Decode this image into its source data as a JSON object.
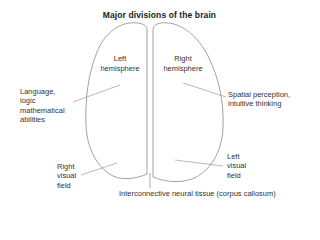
{
  "diagram": {
    "title": "Major divisions of the brain",
    "hemispheres": {
      "left": {
        "line1": "Left",
        "line2": "hemisphere"
      },
      "right": {
        "line1": "Right",
        "line2": "hemisphere"
      }
    },
    "annotations": {
      "language": {
        "line1": "Language,",
        "line2": "logic",
        "line3": "mathematical",
        "line4": "abilities"
      },
      "spatial": {
        "line1": "Spatial perception,",
        "line2": "intuitive thinking"
      },
      "right_visual_field": {
        "line1": "Right",
        "line2": "visual",
        "line3": "field"
      },
      "left_visual_field": {
        "line1": "Left",
        "line2": "visual",
        "line3": "field"
      },
      "corpus_callosum": "Interconnective neural tissue (corpus callosum)"
    },
    "colors": {
      "outline": "#8a8a8a",
      "leader": "#8a8a8a",
      "text": "#333333"
    }
  }
}
